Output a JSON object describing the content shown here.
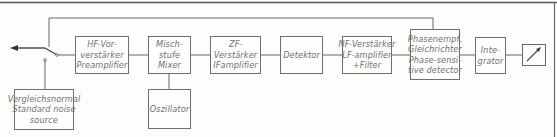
{
  "diagram": {
    "title": "",
    "blocks": {
      "hf": {
        "lines": [
          "HF-Vor-",
          "verstärker",
          "Preamplifier"
        ]
      },
      "mixer": {
        "lines": [
          "Misch-",
          "stufe",
          "Mixer"
        ]
      },
      "zf": {
        "lines": [
          "ZF-",
          "Verstärker",
          "IFamplifier"
        ]
      },
      "det": {
        "lines": [
          "Detektor"
        ]
      },
      "nf": {
        "lines": [
          "NF-Verstärker",
          "LF-amplifier",
          "+Filter"
        ]
      },
      "phase": {
        "lines": [
          "Phasenempf.",
          "Gleichrichter",
          "Phase-sensi-",
          "tive detector"
        ]
      },
      "integ": {
        "lines": [
          "Inte-",
          "grator"
        ]
      },
      "noise": {
        "lines": [
          "Vergleichsnormal",
          "Standard noise",
          "source"
        ]
      },
      "osc": {
        "lines": [
          "Oszillator"
        ]
      },
      "meter": {
        "icon": "meter-needle-icon"
      }
    },
    "connections": [
      {
        "from": "switch",
        "to": "hf"
      },
      {
        "from": "hf",
        "to": "mixer"
      },
      {
        "from": "osc",
        "to": "mixer"
      },
      {
        "from": "mixer",
        "to": "zf"
      },
      {
        "from": "zf",
        "to": "det"
      },
      {
        "from": "det",
        "to": "nf"
      },
      {
        "from": "nf",
        "to": "phase"
      },
      {
        "from": "phase",
        "to": "integ"
      },
      {
        "from": "integ",
        "to": "meter"
      },
      {
        "from": "phase",
        "to": "switch",
        "label": "feedback"
      },
      {
        "from": "noise",
        "to": "switch"
      },
      {
        "from": "switch",
        "to": "output-arrow"
      }
    ]
  }
}
